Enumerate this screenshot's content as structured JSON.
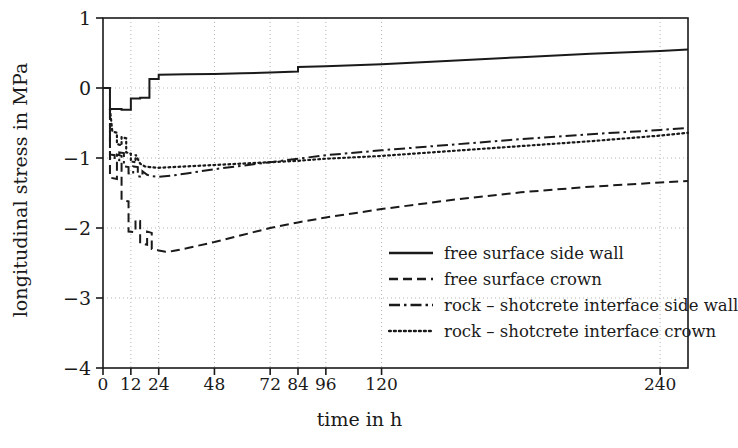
{
  "chart_data": {
    "type": "line",
    "title": "",
    "xlabel": "time in h",
    "ylabel": "longitudinal stress in MPa",
    "xlim": [
      0,
      252
    ],
    "ylim": [
      -4,
      1
    ],
    "xticks": [
      0,
      12,
      24,
      48,
      72,
      84,
      96,
      120,
      240
    ],
    "xtick_labels": [
      "0",
      "12",
      "24",
      "48",
      "72",
      "84",
      "96",
      "120",
      "240"
    ],
    "yticks": [
      1,
      0,
      -1,
      -2,
      -3,
      -4
    ],
    "ytick_labels": [
      "1",
      "0",
      "-1",
      "-2",
      "-3",
      "-4"
    ],
    "grid": "dotted",
    "legend_position": "lower right",
    "series": [
      {
        "name": "free surface side wall",
        "style": "solid",
        "points": [
          [
            0,
            0.0
          ],
          [
            3,
            0.0
          ],
          [
            3,
            -0.3
          ],
          [
            8,
            -0.3
          ],
          [
            8,
            -0.31
          ],
          [
            12,
            -0.31
          ],
          [
            12,
            -0.15
          ],
          [
            16,
            -0.15
          ],
          [
            16,
            -0.14
          ],
          [
            20,
            -0.14
          ],
          [
            20,
            0.13
          ],
          [
            24,
            0.13
          ],
          [
            24,
            0.19
          ],
          [
            36,
            0.195
          ],
          [
            48,
            0.2
          ],
          [
            60,
            0.21
          ],
          [
            72,
            0.22
          ],
          [
            84,
            0.235
          ],
          [
            84,
            0.3
          ],
          [
            96,
            0.31
          ],
          [
            120,
            0.34
          ],
          [
            150,
            0.39
          ],
          [
            180,
            0.44
          ],
          [
            210,
            0.49
          ],
          [
            240,
            0.53
          ],
          [
            252,
            0.55
          ]
        ]
      },
      {
        "name": "free surface crown",
        "style": "dashed",
        "points": [
          [
            3,
            -0.3
          ],
          [
            3,
            -1.28
          ],
          [
            6,
            -1.3
          ],
          [
            6,
            -0.95
          ],
          [
            8,
            -0.97
          ],
          [
            8,
            -1.6
          ],
          [
            11,
            -1.62
          ],
          [
            11,
            -2.05
          ],
          [
            14,
            -2.06
          ],
          [
            14,
            -1.88
          ],
          [
            16,
            -1.9
          ],
          [
            16,
            -2.22
          ],
          [
            19,
            -2.24
          ],
          [
            19,
            -2.05
          ],
          [
            21,
            -2.07
          ],
          [
            21,
            -2.3
          ],
          [
            24,
            -2.32
          ],
          [
            27,
            -2.34
          ],
          [
            30,
            -2.33
          ],
          [
            36,
            -2.29
          ],
          [
            48,
            -2.2
          ],
          [
            60,
            -2.1
          ],
          [
            72,
            -2.0
          ],
          [
            84,
            -1.92
          ],
          [
            96,
            -1.85
          ],
          [
            120,
            -1.73
          ],
          [
            150,
            -1.6
          ],
          [
            180,
            -1.49
          ],
          [
            210,
            -1.41
          ],
          [
            240,
            -1.35
          ],
          [
            252,
            -1.33
          ]
        ]
      },
      {
        "name": "rock - shotcrete interface side wall",
        "style": "dashdot",
        "points": [
          [
            3,
            -0.3
          ],
          [
            3,
            -0.95
          ],
          [
            5,
            -0.96
          ],
          [
            5,
            -1.02
          ],
          [
            7,
            -1.03
          ],
          [
            7,
            -0.92
          ],
          [
            9,
            -0.93
          ],
          [
            9,
            -1.12
          ],
          [
            11,
            -1.13
          ],
          [
            11,
            -1.22
          ],
          [
            13,
            -1.23
          ],
          [
            13,
            -1.12
          ],
          [
            15,
            -1.13
          ],
          [
            15,
            -1.26
          ],
          [
            17,
            -1.27
          ],
          [
            17,
            -1.19
          ],
          [
            19,
            -1.24
          ],
          [
            21,
            -1.26
          ],
          [
            24,
            -1.27
          ],
          [
            30,
            -1.25
          ],
          [
            36,
            -1.22
          ],
          [
            48,
            -1.16
          ],
          [
            60,
            -1.11
          ],
          [
            72,
            -1.06
          ],
          [
            84,
            -1.01
          ],
          [
            96,
            -0.96
          ],
          [
            120,
            -0.89
          ],
          [
            150,
            -0.81
          ],
          [
            180,
            -0.73
          ],
          [
            210,
            -0.66
          ],
          [
            240,
            -0.6
          ],
          [
            252,
            -0.57
          ]
        ]
      },
      {
        "name": "rock - shotcrete interface crown",
        "style": "dotted",
        "points": [
          [
            3,
            -0.3
          ],
          [
            4,
            -0.62
          ],
          [
            6,
            -0.64
          ],
          [
            6,
            -0.8
          ],
          [
            8,
            -0.82
          ],
          [
            8,
            -0.7
          ],
          [
            10,
            -0.72
          ],
          [
            10,
            -0.92
          ],
          [
            12,
            -0.94
          ],
          [
            12,
            -1.05
          ],
          [
            14,
            -1.06
          ],
          [
            14,
            -0.95
          ],
          [
            16,
            -1.08
          ],
          [
            18,
            -1.12
          ],
          [
            20,
            -1.13
          ],
          [
            24,
            -1.14
          ],
          [
            30,
            -1.13
          ],
          [
            36,
            -1.12
          ],
          [
            48,
            -1.1
          ],
          [
            60,
            -1.08
          ],
          [
            72,
            -1.06
          ],
          [
            84,
            -1.04
          ],
          [
            96,
            -1.01
          ],
          [
            120,
            -0.97
          ],
          [
            150,
            -0.9
          ],
          [
            180,
            -0.83
          ],
          [
            210,
            -0.76
          ],
          [
            240,
            -0.68
          ],
          [
            252,
            -0.64
          ]
        ]
      }
    ],
    "legend": [
      {
        "label": "free surface side wall",
        "style": "solid"
      },
      {
        "label": "free surface crown",
        "style": "dashed"
      },
      {
        "label": "rock – shotcrete interface side wall",
        "style": "dashdot"
      },
      {
        "label": "rock – shotcrete interface crown",
        "style": "dotted"
      }
    ],
    "colors": {
      "line": "#1a1a1a",
      "grid": "#b4b4b4",
      "axis": "#1a1a1a",
      "background": "#ffffff"
    }
  }
}
